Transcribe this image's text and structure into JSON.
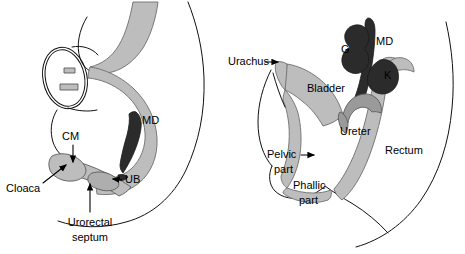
{
  "figure": {
    "background_color": "#ffffff",
    "ink_color": "#111111",
    "organ_light_gray": "#bdbdbd",
    "organ_mid_gray": "#9a9a9a",
    "organ_dark": "#2b2b2b"
  },
  "panels": [
    {
      "id": "left-panel",
      "name": "earlier-stage-cloaca",
      "labels": [
        {
          "key": "cm",
          "text": "CM",
          "x": 70,
          "y": 137,
          "anchor": "start",
          "pointer": "down-arrow"
        },
        {
          "key": "md",
          "text": "MD",
          "x": 142,
          "y": 121,
          "anchor": "start",
          "pointer": "none"
        },
        {
          "key": "ub",
          "text": "UB",
          "x": 122,
          "y": 180,
          "anchor": "start",
          "pointer": "left-arrow"
        },
        {
          "key": "cloaca",
          "text": "Cloaca",
          "x": 8,
          "y": 189,
          "anchor": "start",
          "pointer": "diagonal-arrow"
        },
        {
          "key": "septum1",
          "text": "Urorectal",
          "x": 67,
          "y": 223,
          "anchor": "middle",
          "pointer": "up-arrow"
        },
        {
          "key": "septum2",
          "text": "septum",
          "x": 67,
          "y": 238,
          "anchor": "middle",
          "pointer": "none"
        }
      ]
    },
    {
      "id": "right-panel",
      "name": "later-stage-bladder",
      "labels": [
        {
          "key": "urachus",
          "text": "Urachus",
          "x": 231,
          "y": 62,
          "anchor": "start",
          "pointer": "right-arrow"
        },
        {
          "key": "g",
          "text": "G",
          "x": 345,
          "y": 49,
          "anchor": "start",
          "pointer": "none"
        },
        {
          "key": "md",
          "text": "MD",
          "x": 372,
          "y": 42,
          "anchor": "start",
          "pointer": "none"
        },
        {
          "key": "k",
          "text": "K",
          "x": 386,
          "y": 75,
          "anchor": "start",
          "pointer": "none"
        },
        {
          "key": "bladder",
          "text": "Bladder",
          "x": 310,
          "y": 88,
          "anchor": "start",
          "pointer": "none"
        },
        {
          "key": "ureter",
          "text": "Ureter",
          "x": 340,
          "y": 130,
          "anchor": "start",
          "pointer": "none"
        },
        {
          "key": "rectum",
          "text": "Rectum",
          "x": 386,
          "y": 150,
          "anchor": "start",
          "pointer": "none"
        },
        {
          "key": "pelvic1",
          "text": "Pelvic",
          "x": 272,
          "y": 155,
          "anchor": "start",
          "pointer": "right-arrow"
        },
        {
          "key": "pelvic2",
          "text": "part",
          "x": 278,
          "y": 170,
          "anchor": "start",
          "pointer": "none"
        },
        {
          "key": "phallic1",
          "text": "Phallic",
          "x": 300,
          "y": 186,
          "anchor": "start",
          "pointer": "none"
        },
        {
          "key": "phallic2",
          "text": "part",
          "x": 305,
          "y": 200,
          "anchor": "start",
          "pointer": "none"
        }
      ]
    }
  ],
  "abbreviations": {
    "CM": "cloacal membrane",
    "MD": "mesonephric duct",
    "UB": "ureteric bud",
    "G": "gonad",
    "K": "kidney"
  }
}
